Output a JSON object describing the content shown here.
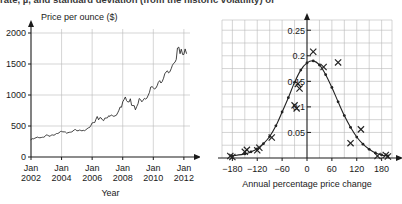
{
  "page": {
    "clipped_text": "rate, µ, and standard deviation (from the historic volatility) of"
  },
  "chart_data": [
    {
      "id": "gold-price-timeseries",
      "type": "line",
      "title": "",
      "ylabel": "Price per ounce ($)",
      "xlabel": "Year",
      "ylim": [
        0,
        2000
      ],
      "yticks": [
        0,
        500,
        1000,
        1500,
        2000
      ],
      "yticklabels": [
        "0",
        "500",
        "1000",
        "1500",
        "2000"
      ],
      "xlim": [
        2002,
        2012.4
      ],
      "xticks": [
        2002,
        2004,
        2006,
        2008,
        2010,
        2012
      ],
      "xticklabels": [
        "Jan\n2002",
        "Jan\n2004",
        "Jan\n2006",
        "Jan\n2008",
        "Jan\n2010",
        "Jan\n2012"
      ],
      "xticklabels_line1": [
        "Jan",
        "Jan",
        "Jan",
        "Jan",
        "Jan",
        "Jan"
      ],
      "xticklabels_line2": [
        "2002",
        "2004",
        "2006",
        "2008",
        "2010",
        "2012"
      ],
      "grid": true,
      "legend": "none",
      "series": [
        {
          "name": "Gold price",
          "x": [
            2002.0,
            2002.08,
            2002.17,
            2002.25,
            2002.33,
            2002.42,
            2002.5,
            2002.58,
            2002.67,
            2002.75,
            2002.83,
            2002.92,
            2003.0,
            2003.08,
            2003.17,
            2003.25,
            2003.33,
            2003.42,
            2003.5,
            2003.58,
            2003.67,
            2003.75,
            2003.83,
            2003.92,
            2004.0,
            2004.08,
            2004.17,
            2004.25,
            2004.33,
            2004.42,
            2004.5,
            2004.58,
            2004.67,
            2004.75,
            2004.83,
            2004.92,
            2005.0,
            2005.08,
            2005.17,
            2005.25,
            2005.33,
            2005.42,
            2005.5,
            2005.58,
            2005.67,
            2005.75,
            2005.83,
            2005.92,
            2006.0,
            2006.08,
            2006.17,
            2006.25,
            2006.33,
            2006.42,
            2006.5,
            2006.58,
            2006.67,
            2006.75,
            2006.83,
            2006.92,
            2007.0,
            2007.08,
            2007.17,
            2007.25,
            2007.33,
            2007.42,
            2007.5,
            2007.58,
            2007.67,
            2007.75,
            2007.83,
            2007.92,
            2008.0,
            2008.08,
            2008.17,
            2008.25,
            2008.33,
            2008.42,
            2008.5,
            2008.58,
            2008.67,
            2008.75,
            2008.83,
            2008.92,
            2009.0,
            2009.08,
            2009.17,
            2009.25,
            2009.33,
            2009.42,
            2009.5,
            2009.58,
            2009.67,
            2009.75,
            2009.83,
            2009.92,
            2010.0,
            2010.08,
            2010.17,
            2010.25,
            2010.33,
            2010.42,
            2010.5,
            2010.58,
            2010.67,
            2010.75,
            2010.83,
            2010.92,
            2011.0,
            2011.08,
            2011.17,
            2011.25,
            2011.33,
            2011.42,
            2011.5,
            2011.58,
            2011.67,
            2011.75,
            2011.83,
            2011.92,
            2012.0,
            2012.08,
            2012.17
          ],
          "y": [
            281,
            295,
            293,
            303,
            312,
            321,
            313,
            310,
            314,
            319,
            319,
            333,
            357,
            352,
            340,
            333,
            355,
            356,
            351,
            363,
            379,
            379,
            390,
            410,
            414,
            405,
            406,
            403,
            384,
            392,
            398,
            400,
            405,
            420,
            438,
            442,
            424,
            423,
            434,
            429,
            422,
            430,
            424,
            437,
            456,
            470,
            476,
            510,
            550,
            555,
            557,
            610,
            653,
            600,
            634,
            632,
            600,
            586,
            627,
            629,
            632,
            665,
            655,
            679,
            667,
            655,
            665,
            672,
            712,
            754,
            807,
            803,
            890,
            923,
            968,
            910,
            888,
            889,
            939,
            833,
            829,
            829,
            761,
            816,
            858,
            943,
            924,
            890,
            915,
            946,
            934,
            949,
            997,
            1043,
            1128,
            1135,
            1118,
            1095,
            1113,
            1149,
            1205,
            1232,
            1193,
            1216,
            1271,
            1342,
            1370,
            1390,
            1356,
            1373,
            1424,
            1480,
            1510,
            1529,
            1573,
            1758,
            1772,
            1666,
            1739,
            1652,
            1654,
            1743,
            1672
          ]
        }
      ]
    },
    {
      "id": "annual-price-change-distribution",
      "type": "scatter",
      "title": "",
      "ylabel": "",
      "xlabel": "Annual percentage price change",
      "ylim": [
        0,
        0.27
      ],
      "yticks": [
        0.05,
        0.1,
        0.15,
        0.2,
        0.25
      ],
      "yticklabels": [
        "0.05",
        "0.1",
        "0.15",
        "0.2",
        "0.25"
      ],
      "xlim": [
        -205,
        205
      ],
      "xticks": [
        -180,
        -120,
        -60,
        0,
        60,
        120,
        180
      ],
      "xticklabels": [
        "−180",
        "−120",
        "−60",
        "0",
        "60",
        "120",
        "180"
      ],
      "grid": true,
      "legend": "none",
      "series": [
        {
          "name": "Fitted distribution curve",
          "marker": "filled-dot",
          "x": [
            -180,
            -150,
            -135,
            -120,
            -105,
            -90,
            -75,
            -60,
            -45,
            -30,
            -15,
            0,
            15,
            30,
            45,
            60,
            75,
            90,
            105,
            120,
            135,
            150,
            165,
            180,
            195
          ],
          "y": [
            0.004,
            0.008,
            0.012,
            0.018,
            0.028,
            0.042,
            0.063,
            0.09,
            0.118,
            0.148,
            0.172,
            0.186,
            0.19,
            0.182,
            0.163,
            0.138,
            0.11,
            0.083,
            0.06,
            0.041,
            0.027,
            0.017,
            0.01,
            0.006,
            0.004
          ]
        },
        {
          "name": "Observed data points",
          "marker": "cross",
          "x": [
            -185,
            -180,
            -150,
            -145,
            -120,
            -115,
            -85,
            -30,
            -25,
            -22,
            -18,
            15,
            40,
            75,
            105,
            130,
            170,
            190,
            195
          ],
          "y": [
            0.004,
            0.002,
            0.012,
            0.016,
            0.015,
            0.02,
            0.04,
            0.103,
            0.097,
            0.145,
            0.136,
            0.208,
            0.178,
            0.187,
            0.029,
            0.056,
            0.004,
            0.006,
            0.003
          ]
        }
      ]
    }
  ]
}
